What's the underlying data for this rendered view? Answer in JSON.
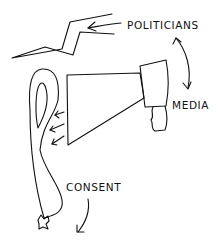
{
  "diagram": {
    "labels": {
      "politicians": "POLITICIANS",
      "media": "MEDIA",
      "consent": "CONSENT"
    },
    "elements": [
      {
        "name": "lightning-bolt",
        "description": "zigzag bolt representing politicians' voice"
      },
      {
        "name": "megaphone",
        "description": "megaphone representing media"
      },
      {
        "name": "balloon",
        "description": "tied balloon being inflated, representing consent"
      }
    ],
    "relations": [
      {
        "from": "politicians",
        "to": "lightning-bolt",
        "type": "arrow"
      },
      {
        "from": "politicians",
        "to": "media",
        "type": "double-arrow"
      },
      {
        "from": "megaphone",
        "to": "balloon",
        "type": "air-arrows",
        "count": 3
      },
      {
        "from": "consent",
        "to": "below",
        "type": "curved-arrow"
      }
    ],
    "colors": {
      "ink": "#111111",
      "background": "#ffffff"
    }
  }
}
